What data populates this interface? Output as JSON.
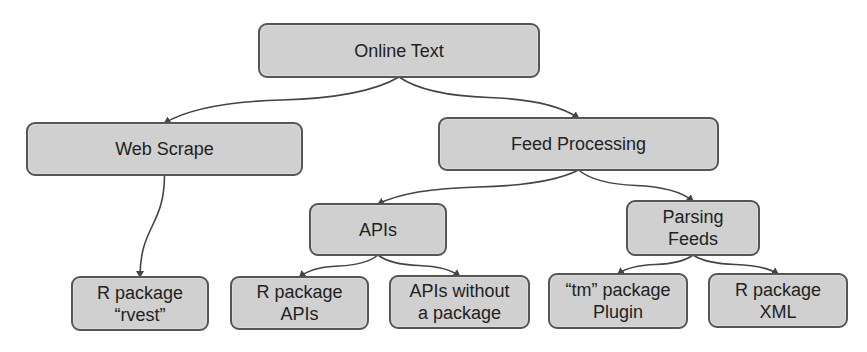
{
  "diagram": {
    "type": "tree",
    "colors": {
      "node_fill": "#d0d0d0",
      "node_border": "#555555",
      "text": "#222222",
      "edge": "#444444",
      "background": "#ffffff"
    },
    "nodes": [
      {
        "id": "online-text",
        "lines": [
          "Online Text"
        ],
        "x": 258,
        "y": 23,
        "w": 282,
        "h": 55
      },
      {
        "id": "web-scrape",
        "lines": [
          "Web Scrape"
        ],
        "x": 26,
        "y": 122,
        "w": 277,
        "h": 54
      },
      {
        "id": "feed-processing",
        "lines": [
          "Feed Processing"
        ],
        "x": 438,
        "y": 117,
        "w": 281,
        "h": 54
      },
      {
        "id": "apis",
        "lines": [
          "APIs"
        ],
        "x": 309,
        "y": 203,
        "w": 138,
        "h": 53
      },
      {
        "id": "parsing-feeds",
        "lines": [
          "Parsing",
          "Feeds"
        ],
        "x": 626,
        "y": 200,
        "w": 134,
        "h": 56
      },
      {
        "id": "r-package-rvest",
        "lines": [
          "R package",
          "“rvest”"
        ],
        "x": 71,
        "y": 276,
        "w": 138,
        "h": 55
      },
      {
        "id": "r-package-apis",
        "lines": [
          "R package",
          "APIs"
        ],
        "x": 230,
        "y": 276,
        "w": 139,
        "h": 54
      },
      {
        "id": "apis-without-package",
        "lines": [
          "APIs without",
          "a package"
        ],
        "x": 389,
        "y": 275,
        "w": 141,
        "h": 54
      },
      {
        "id": "tm-package-plugin",
        "lines": [
          "“tm” package",
          "Plugin"
        ],
        "x": 548,
        "y": 273,
        "w": 140,
        "h": 56
      },
      {
        "id": "r-package-xml",
        "lines": [
          "R package",
          "XML"
        ],
        "x": 708,
        "y": 273,
        "w": 140,
        "h": 55
      }
    ],
    "edges": [
      {
        "from": "online-text",
        "to": "web-scrape"
      },
      {
        "from": "online-text",
        "to": "feed-processing"
      },
      {
        "from": "web-scrape",
        "to": "r-package-rvest"
      },
      {
        "from": "feed-processing",
        "to": "apis"
      },
      {
        "from": "feed-processing",
        "to": "parsing-feeds"
      },
      {
        "from": "apis",
        "to": "r-package-apis"
      },
      {
        "from": "apis",
        "to": "apis-without-package"
      },
      {
        "from": "parsing-feeds",
        "to": "tm-package-plugin"
      },
      {
        "from": "parsing-feeds",
        "to": "r-package-xml"
      }
    ]
  }
}
